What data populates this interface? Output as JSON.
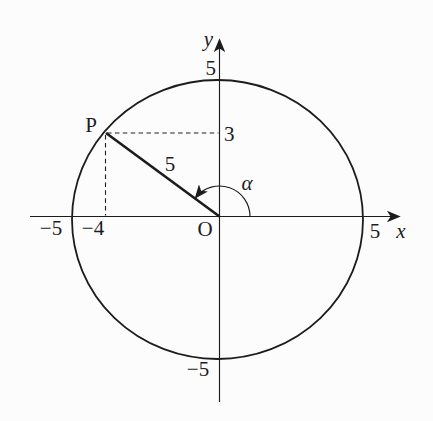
{
  "figure": {
    "type": "circle-angle-diagram",
    "colors": {
      "background": "#fcfcfc",
      "ink": "#1c1c1c"
    },
    "axes": {
      "x_label": "x",
      "y_label": "y",
      "origin_label": "O"
    },
    "circle": {
      "radius_value": 5
    },
    "point_p": {
      "label": "P",
      "x_value": -4,
      "y_value": 3
    },
    "labels": {
      "y_axis_top_tick": "5",
      "y_axis_bottom_tick": "−5",
      "x_axis_right_tick": "5",
      "x_axis_left_tick": "−5",
      "p_x_projection_tick": "−4",
      "p_y_projection_tick": "3",
      "radius_segment": "5",
      "angle": "α"
    }
  }
}
